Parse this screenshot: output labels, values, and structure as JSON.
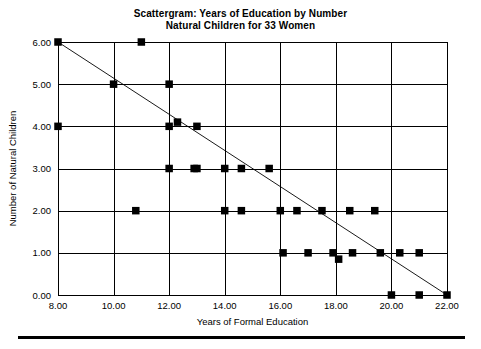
{
  "chart_data": {
    "type": "scatter",
    "title": "Scattergram: Years of Education by Number Natural Children for 33 Women",
    "title_lines": [
      "Scattergram: Years of Education by Number",
      "Natural Children for 33 Women"
    ],
    "xlabel": "Years of Formal Education",
    "ylabel": "Number of Natural Children",
    "xlim": [
      8,
      22
    ],
    "ylim": [
      0,
      6
    ],
    "xticks": [
      8,
      10,
      12,
      14,
      16,
      18,
      20,
      22
    ],
    "xticklabels": [
      "8.00",
      "10.00",
      "12.00",
      "14.00",
      "16.00",
      "18.00",
      "20.00",
      "22.00"
    ],
    "yticks": [
      0,
      1,
      2,
      3,
      4,
      5,
      6
    ],
    "yticklabels": [
      "0.00",
      "1.00",
      "2.00",
      "3.00",
      "4.00",
      "5.00",
      "6.00"
    ],
    "grid": true,
    "legend": "none",
    "n_points": 33,
    "marker": "square",
    "marker_color": "#000000",
    "points": [
      {
        "x": 8.0,
        "y": 6.0
      },
      {
        "x": 11.0,
        "y": 6.0
      },
      {
        "x": 10.0,
        "y": 5.0
      },
      {
        "x": 12.0,
        "y": 5.0
      },
      {
        "x": 8.0,
        "y": 4.0
      },
      {
        "x": 12.0,
        "y": 4.0
      },
      {
        "x": 12.3,
        "y": 4.1
      },
      {
        "x": 13.0,
        "y": 4.0
      },
      {
        "x": 12.0,
        "y": 3.0
      },
      {
        "x": 12.9,
        "y": 3.0
      },
      {
        "x": 14.0,
        "y": 3.0
      },
      {
        "x": 14.6,
        "y": 3.0
      },
      {
        "x": 15.6,
        "y": 3.0
      },
      {
        "x": 10.8,
        "y": 2.0
      },
      {
        "x": 14.0,
        "y": 2.0
      },
      {
        "x": 14.6,
        "y": 2.0
      },
      {
        "x": 16.0,
        "y": 2.0
      },
      {
        "x": 16.6,
        "y": 2.0
      },
      {
        "x": 17.5,
        "y": 2.0
      },
      {
        "x": 18.5,
        "y": 2.0
      },
      {
        "x": 19.4,
        "y": 2.0
      },
      {
        "x": 16.1,
        "y": 1.0
      },
      {
        "x": 17.0,
        "y": 1.0
      },
      {
        "x": 17.9,
        "y": 1.0
      },
      {
        "x": 18.1,
        "y": 0.85
      },
      {
        "x": 18.6,
        "y": 1.0
      },
      {
        "x": 19.6,
        "y": 1.0
      },
      {
        "x": 20.3,
        "y": 1.0
      },
      {
        "x": 21.0,
        "y": 1.0
      },
      {
        "x": 20.0,
        "y": 0.0
      },
      {
        "x": 21.0,
        "y": 0.0
      },
      {
        "x": 22.0,
        "y": 0.0
      },
      {
        "x": 13.0,
        "y": 3.0
      }
    ],
    "fit_line": {
      "type": "linear-regression",
      "x0": 8.0,
      "y0": 6.0,
      "x1": 22.0,
      "y1": 0.0
    }
  }
}
